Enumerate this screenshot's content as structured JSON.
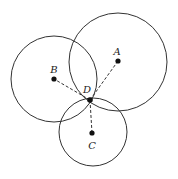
{
  "diagram": {
    "circles": [
      {
        "name": "A",
        "cx": 118,
        "cy": 62,
        "r": 49
      },
      {
        "name": "B",
        "cx": 54,
        "cy": 79,
        "r": 43
      },
      {
        "name": "C",
        "cx": 93,
        "cy": 132,
        "r": 34
      }
    ],
    "points": [
      {
        "name": "A",
        "label": "A",
        "x": 118,
        "y": 61,
        "lx": 117,
        "ly": 55
      },
      {
        "name": "B",
        "label": "B",
        "x": 54,
        "y": 79,
        "lx": 54,
        "ly": 73
      },
      {
        "name": "C",
        "label": "C",
        "x": 92,
        "y": 133,
        "lx": 92,
        "ly": 149
      },
      {
        "name": "D",
        "label": "D",
        "x": 90,
        "y": 100,
        "lx": 87,
        "ly": 93
      }
    ],
    "dashed_segments": [
      {
        "from": "D",
        "to": "A"
      },
      {
        "from": "D",
        "to": "B"
      },
      {
        "from": "D",
        "to": "C"
      }
    ],
    "colors": {
      "stroke": "#333333",
      "point": "#111111",
      "background": "#ffffff"
    }
  }
}
